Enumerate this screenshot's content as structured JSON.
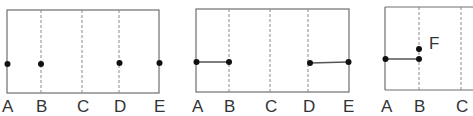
{
  "panels": [
    {
      "id": "panel-1",
      "labels": [
        "A",
        "B",
        "C",
        "D",
        "E"
      ],
      "points": [
        "A",
        "B",
        "D",
        "E"
      ],
      "segments": []
    },
    {
      "id": "panel-2",
      "labels": [
        "A",
        "B",
        "C",
        "D",
        "E"
      ],
      "points": [
        "A",
        "B",
        "D",
        "E"
      ],
      "segments": [
        [
          "A",
          "B"
        ],
        [
          "D",
          "E"
        ]
      ]
    },
    {
      "id": "panel-3",
      "labels": [
        "A",
        "B",
        "C"
      ],
      "points": [
        "A",
        "B",
        "F"
      ],
      "segments": [
        [
          "A",
          "B"
        ]
      ],
      "extra_label": "F"
    }
  ]
}
